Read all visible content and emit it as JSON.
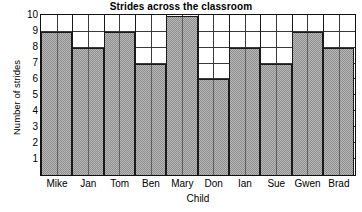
{
  "chart_data": {
    "type": "bar",
    "title": "Strides across the classroom",
    "xlabel": "Child",
    "ylabel": "Number of strides",
    "categories": [
      "Mike",
      "Jan",
      "Tom",
      "Ben",
      "Mary",
      "Don",
      "Ian",
      "Sue",
      "Gwen",
      "Brad"
    ],
    "values": [
      9,
      8,
      9,
      7,
      10,
      6,
      8,
      7,
      9,
      8
    ],
    "ylim": [
      0,
      10
    ],
    "ytick_labels": [
      "10",
      "9",
      "8",
      "7",
      "6",
      "5",
      "4",
      "3",
      "2",
      "1"
    ],
    "ytick_values": [
      10,
      9,
      8,
      7,
      6,
      5,
      4,
      3,
      2,
      1
    ],
    "grid": true,
    "grid_vertical_divisions_per_bar": 2,
    "legend": "none",
    "bar_fill": "#b9b9b9",
    "bar_pattern": "checkerboard-dither",
    "bar_border": "#1a1a1a",
    "axis_color": "#111111",
    "grid_color": "#3a3a3a",
    "background": "#ffffff"
  }
}
